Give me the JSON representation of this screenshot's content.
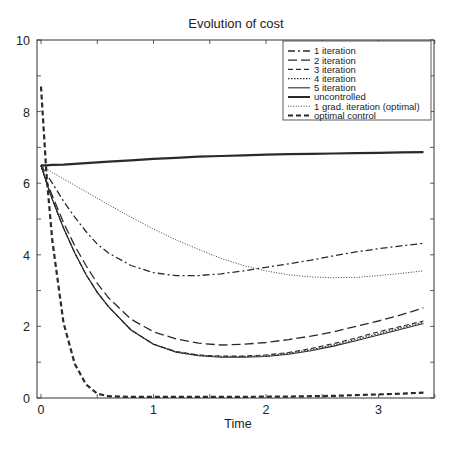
{
  "chart_data": {
    "type": "line",
    "title": "Evolution of cost",
    "xlabel": "Time",
    "ylabel": "",
    "xlim": [
      0,
      3.5
    ],
    "ylim": [
      0,
      10
    ],
    "xticks": [
      0,
      1,
      2,
      3
    ],
    "yticks": [
      0,
      2,
      4,
      6,
      8,
      10
    ],
    "grid": false,
    "legend_position": "upper right",
    "x": [
      0,
      0.05,
      0.1,
      0.2,
      0.3,
      0.4,
      0.5,
      0.6,
      0.8,
      1.0,
      1.2,
      1.4,
      1.6,
      1.8,
      2.0,
      2.2,
      2.4,
      2.6,
      2.8,
      3.0,
      3.2,
      3.4
    ],
    "series": [
      {
        "name": "1 iteration",
        "style": "dashdot",
        "width": 1.3,
        "values": [
          6.5,
          6.25,
          6.0,
          5.5,
          5.05,
          4.65,
          4.3,
          4.05,
          3.7,
          3.5,
          3.42,
          3.42,
          3.47,
          3.55,
          3.65,
          3.75,
          3.85,
          3.97,
          4.08,
          4.17,
          4.25,
          4.32
        ]
      },
      {
        "name": "2 iteration",
        "style": "longdash",
        "width": 1.3,
        "values": [
          6.5,
          6.05,
          5.65,
          4.9,
          4.25,
          3.7,
          3.2,
          2.8,
          2.2,
          1.85,
          1.65,
          1.53,
          1.48,
          1.5,
          1.55,
          1.63,
          1.73,
          1.85,
          2.0,
          2.15,
          2.32,
          2.52
        ]
      },
      {
        "name": "3 iteration",
        "style": "dash",
        "width": 1.1,
        "values": [
          6.5,
          6.0,
          5.55,
          4.75,
          4.05,
          3.45,
          2.95,
          2.55,
          1.9,
          1.5,
          1.3,
          1.2,
          1.17,
          1.17,
          1.2,
          1.27,
          1.38,
          1.52,
          1.68,
          1.85,
          2.0,
          2.15
        ]
      },
      {
        "name": "4 iteration",
        "style": "dot",
        "width": 1.1,
        "values": [
          6.5,
          6.0,
          5.55,
          4.75,
          4.05,
          3.45,
          2.95,
          2.55,
          1.9,
          1.5,
          1.3,
          1.2,
          1.16,
          1.16,
          1.18,
          1.25,
          1.35,
          1.48,
          1.64,
          1.8,
          1.96,
          2.12
        ]
      },
      {
        "name": "5 iteration",
        "style": "solid",
        "width": 1.1,
        "values": [
          6.5,
          6.0,
          5.55,
          4.75,
          4.05,
          3.45,
          2.95,
          2.55,
          1.9,
          1.5,
          1.28,
          1.18,
          1.14,
          1.14,
          1.16,
          1.22,
          1.32,
          1.45,
          1.6,
          1.76,
          1.92,
          2.08
        ]
      },
      {
        "name": "uncontrolled",
        "style": "solid",
        "width": 2.2,
        "values": [
          6.5,
          6.5,
          6.51,
          6.52,
          6.54,
          6.56,
          6.58,
          6.6,
          6.64,
          6.68,
          6.71,
          6.74,
          6.76,
          6.78,
          6.8,
          6.81,
          6.82,
          6.83,
          6.84,
          6.85,
          6.86,
          6.87
        ]
      },
      {
        "name": "1 grad. iteration (optimal)",
        "style": "finedot",
        "width": 0.9,
        "values": [
          6.5,
          6.4,
          6.3,
          6.12,
          5.94,
          5.76,
          5.58,
          5.4,
          5.05,
          4.72,
          4.42,
          4.15,
          3.9,
          3.7,
          3.55,
          3.44,
          3.38,
          3.36,
          3.37,
          3.42,
          3.48,
          3.55
        ]
      },
      {
        "name": "optimal control",
        "style": "heavydash",
        "width": 2.2,
        "values": [
          8.7,
          6.2,
          4.4,
          2.1,
          0.95,
          0.38,
          0.12,
          0.05,
          0.03,
          0.03,
          0.03,
          0.03,
          0.03,
          0.03,
          0.04,
          0.04,
          0.05,
          0.06,
          0.08,
          0.1,
          0.12,
          0.15
        ]
      }
    ]
  },
  "colors": {
    "line": "#2a2a2a",
    "axis": "#333333",
    "background": "#ffffff"
  }
}
